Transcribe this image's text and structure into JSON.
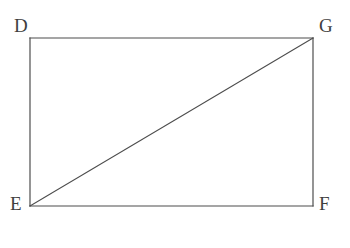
{
  "figure": {
    "kind": "geometry-diagram",
    "background_color": "#ffffff",
    "stroke_color": "#4d4d4d",
    "stroke_width": 1.2,
    "canvas": {
      "width": 350,
      "height": 248
    },
    "vertices": [
      {
        "id": "D",
        "label": "D",
        "x": 30,
        "y": 38,
        "corner": "top-left"
      },
      {
        "id": "G",
        "label": "G",
        "x": 313,
        "y": 38,
        "corner": "top-right"
      },
      {
        "id": "E",
        "label": "E",
        "x": 30,
        "y": 206,
        "corner": "bottom-left"
      },
      {
        "id": "F",
        "label": "F",
        "x": 313,
        "y": 206,
        "corner": "bottom-right"
      }
    ],
    "edges": [
      {
        "id": "DG",
        "from": "D",
        "to": "G",
        "role": "top-side"
      },
      {
        "id": "GF",
        "from": "G",
        "to": "F",
        "role": "right-side"
      },
      {
        "id": "FE",
        "from": "F",
        "to": "E",
        "role": "bottom-side"
      },
      {
        "id": "ED",
        "from": "E",
        "to": "D",
        "role": "left-side"
      },
      {
        "id": "EG",
        "from": "E",
        "to": "G",
        "role": "diagonal"
      }
    ],
    "rectangle": {
      "x": 30,
      "y": 38,
      "width": 283,
      "height": 168
    },
    "diagonal": {
      "x1": 30,
      "y1": 206,
      "x2": 313,
      "y2": 38
    }
  }
}
